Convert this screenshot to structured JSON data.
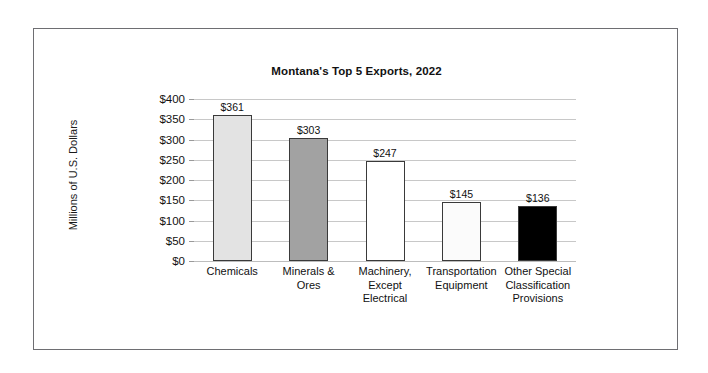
{
  "chart_data": {
    "type": "bar",
    "title": "Montana's Top 5 Exports, 2022",
    "xlabel": "",
    "ylabel": "Millions of U.S. Dollars",
    "ylim": [
      0,
      400
    ],
    "ytick_step": 50,
    "ytick_labels": [
      "$400",
      "$350",
      "$300",
      "$250",
      "$200",
      "$150",
      "$100",
      "$50",
      "$0"
    ],
    "ytick_values": [
      400,
      350,
      300,
      250,
      200,
      150,
      100,
      50,
      0
    ],
    "grid": true,
    "legend": "none",
    "categories": [
      "Chemicals",
      "Minerals & Ores",
      "Machinery, Except Electrical",
      "Transportation Equipment",
      "Other Special Classification Provisions"
    ],
    "category_lines": [
      [
        "Chemicals"
      ],
      [
        "Minerals &",
        "Ores"
      ],
      [
        "Machinery,",
        "Except",
        "Electrical"
      ],
      [
        "Transportation",
        "Equipment"
      ],
      [
        "Other Special",
        "Classification",
        "Provisions"
      ]
    ],
    "values": [
      361,
      303,
      247,
      145,
      136
    ],
    "value_labels": [
      "$361",
      "$303",
      "$247",
      "$145",
      "$136"
    ],
    "bar_colors": [
      "#e3e3e3",
      "#a2a2a2",
      "#ffffff",
      "#fbfbfb",
      "#000000"
    ],
    "bar_border_color": "#3a3a3a",
    "gridline_color": "#c8c8c8",
    "frame_border_color": "#6e6e72",
    "background": "#ffffff"
  }
}
